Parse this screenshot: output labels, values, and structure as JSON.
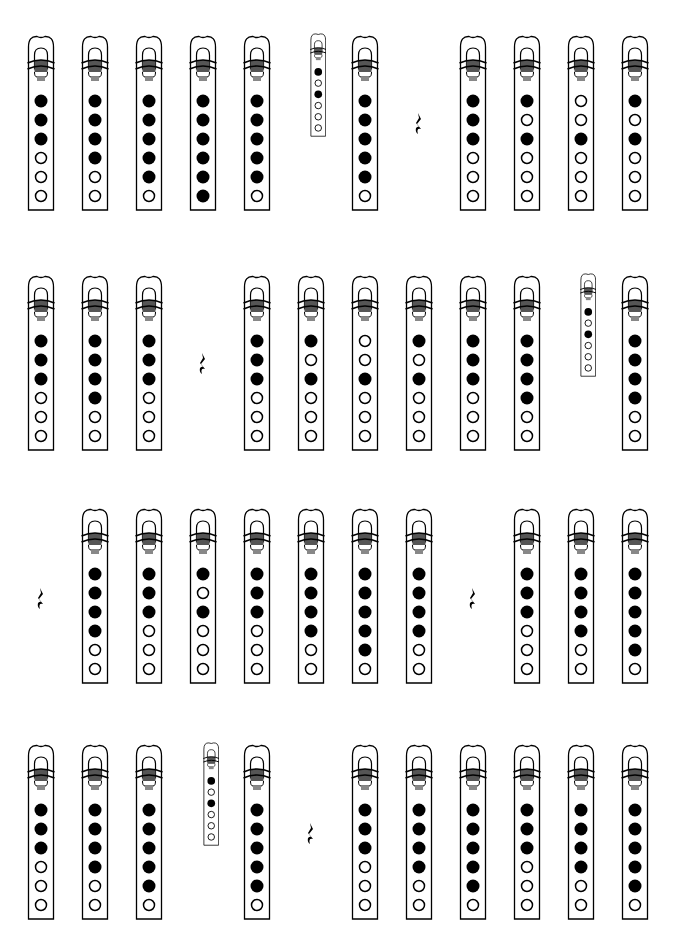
{
  "colors": {
    "ink": "#000000",
    "band": "#555555",
    "paper": "#ffffff"
  },
  "legend": {
    "closed": "covered hole",
    "open": "open hole"
  },
  "rows": [
    {
      "top": 35,
      "items": [
        {
          "type": "whistle",
          "x": 41,
          "holes": [
            1,
            1,
            1,
            0,
            0,
            0
          ]
        },
        {
          "type": "whistle",
          "x": 95,
          "holes": [
            1,
            1,
            1,
            1,
            0,
            0
          ]
        },
        {
          "type": "whistle",
          "x": 149,
          "holes": [
            1,
            1,
            1,
            1,
            1,
            0
          ]
        },
        {
          "type": "whistle",
          "x": 203,
          "holes": [
            1,
            1,
            1,
            1,
            1,
            1
          ]
        },
        {
          "type": "whistle",
          "x": 257,
          "holes": [
            1,
            1,
            1,
            1,
            1,
            0
          ]
        },
        {
          "type": "grace",
          "x": 318,
          "y": 33,
          "holes": [
            1,
            0,
            1,
            0,
            0,
            0
          ]
        },
        {
          "type": "whistle",
          "x": 365,
          "holes": [
            1,
            1,
            1,
            1,
            1,
            0
          ]
        },
        {
          "type": "rest",
          "x": 419,
          "y": 112
        },
        {
          "type": "whistle",
          "x": 473,
          "holes": [
            1,
            1,
            1,
            0,
            0,
            0
          ]
        },
        {
          "type": "whistle",
          "x": 527,
          "holes": [
            1,
            0,
            1,
            0,
            0,
            0
          ]
        },
        {
          "type": "whistle",
          "x": 581,
          "holes": [
            0,
            0,
            1,
            0,
            0,
            0
          ]
        },
        {
          "type": "whistle",
          "x": 635,
          "holes": [
            1,
            0,
            1,
            0,
            0,
            0
          ]
        }
      ]
    },
    {
      "top": 275,
      "items": [
        {
          "type": "whistle",
          "x": 41,
          "holes": [
            1,
            1,
            1,
            0,
            0,
            0
          ]
        },
        {
          "type": "whistle",
          "x": 95,
          "holes": [
            1,
            1,
            1,
            1,
            0,
            0
          ]
        },
        {
          "type": "whistle",
          "x": 149,
          "holes": [
            1,
            1,
            1,
            0,
            0,
            0
          ]
        },
        {
          "type": "rest",
          "x": 203,
          "y": 352
        },
        {
          "type": "whistle",
          "x": 257,
          "holes": [
            1,
            1,
            1,
            0,
            0,
            0
          ]
        },
        {
          "type": "whistle",
          "x": 311,
          "holes": [
            1,
            0,
            1,
            0,
            0,
            0
          ]
        },
        {
          "type": "whistle",
          "x": 365,
          "holes": [
            0,
            0,
            1,
            0,
            0,
            0
          ]
        },
        {
          "type": "whistle",
          "x": 419,
          "holes": [
            1,
            0,
            1,
            0,
            0,
            0
          ]
        },
        {
          "type": "whistle",
          "x": 473,
          "holes": [
            1,
            1,
            1,
            0,
            0,
            0
          ]
        },
        {
          "type": "whistle",
          "x": 527,
          "holes": [
            1,
            1,
            1,
            1,
            0,
            0
          ]
        },
        {
          "type": "grace",
          "x": 588,
          "y": 273,
          "holes": [
            1,
            0,
            1,
            0,
            0,
            0
          ]
        },
        {
          "type": "whistle",
          "x": 635,
          "holes": [
            1,
            1,
            1,
            1,
            0,
            0
          ]
        }
      ]
    },
    {
      "top": 508,
      "items": [
        {
          "type": "rest",
          "x": 41,
          "y": 587
        },
        {
          "type": "whistle",
          "x": 95,
          "holes": [
            1,
            1,
            1,
            1,
            0,
            0
          ]
        },
        {
          "type": "whistle",
          "x": 149,
          "holes": [
            1,
            1,
            1,
            0,
            0,
            0
          ]
        },
        {
          "type": "whistle",
          "x": 203,
          "holes": [
            1,
            0,
            1,
            0,
            0,
            0
          ]
        },
        {
          "type": "whistle",
          "x": 257,
          "holes": [
            1,
            1,
            1,
            0,
            0,
            0
          ]
        },
        {
          "type": "whistle",
          "x": 311,
          "holes": [
            1,
            1,
            1,
            1,
            0,
            0
          ]
        },
        {
          "type": "whistle",
          "x": 365,
          "holes": [
            1,
            1,
            1,
            1,
            1,
            0
          ]
        },
        {
          "type": "whistle",
          "x": 419,
          "holes": [
            1,
            1,
            1,
            1,
            0,
            0
          ]
        },
        {
          "type": "rest",
          "x": 473,
          "y": 587
        },
        {
          "type": "whistle",
          "x": 527,
          "holes": [
            1,
            1,
            1,
            0,
            0,
            0
          ]
        },
        {
          "type": "whistle",
          "x": 581,
          "holes": [
            1,
            1,
            1,
            1,
            0,
            0
          ]
        },
        {
          "type": "whistle",
          "x": 635,
          "holes": [
            1,
            1,
            1,
            1,
            1,
            0
          ]
        }
      ]
    },
    {
      "top": 744,
      "items": [
        {
          "type": "whistle",
          "x": 41,
          "holes": [
            1,
            1,
            1,
            0,
            0,
            0
          ]
        },
        {
          "type": "whistle",
          "x": 95,
          "holes": [
            1,
            1,
            1,
            1,
            0,
            0
          ]
        },
        {
          "type": "whistle",
          "x": 149,
          "holes": [
            1,
            1,
            1,
            1,
            1,
            0
          ]
        },
        {
          "type": "grace",
          "x": 211,
          "y": 742,
          "holes": [
            1,
            0,
            1,
            0,
            0,
            0
          ]
        },
        {
          "type": "whistle",
          "x": 257,
          "holes": [
            1,
            1,
            1,
            1,
            1,
            0
          ]
        },
        {
          "type": "rest",
          "x": 311,
          "y": 822
        },
        {
          "type": "whistle",
          "x": 365,
          "holes": [
            1,
            1,
            1,
            0,
            0,
            0
          ]
        },
        {
          "type": "whistle",
          "x": 419,
          "holes": [
            1,
            1,
            1,
            1,
            0,
            0
          ]
        },
        {
          "type": "whistle",
          "x": 473,
          "holes": [
            1,
            1,
            1,
            1,
            1,
            0
          ]
        },
        {
          "type": "whistle",
          "x": 527,
          "holes": [
            1,
            1,
            1,
            0,
            0,
            0
          ]
        },
        {
          "type": "whistle",
          "x": 581,
          "holes": [
            1,
            1,
            1,
            1,
            0,
            0
          ]
        },
        {
          "type": "whistle",
          "x": 635,
          "holes": [
            1,
            1,
            1,
            1,
            1,
            0
          ]
        }
      ]
    }
  ]
}
